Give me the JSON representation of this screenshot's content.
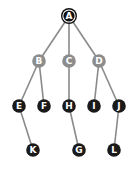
{
  "diagram": {
    "type": "tree",
    "colors": {
      "background": "#ffffff",
      "edge": "#8a8a8a",
      "root_fill": "#111111",
      "root_ring": "#111111",
      "level1_fill": "#8c8c8c",
      "leaf_fill": "#1a1a1a",
      "label": "#ffffff"
    },
    "nodes": [
      {
        "id": "A",
        "label": "A",
        "x": 69,
        "y": 16,
        "style": "root"
      },
      {
        "id": "B",
        "label": "B",
        "x": 39,
        "y": 61,
        "style": "gray"
      },
      {
        "id": "C",
        "label": "C",
        "x": 69,
        "y": 61,
        "style": "gray"
      },
      {
        "id": "D",
        "label": "D",
        "x": 99,
        "y": 61,
        "style": "gray"
      },
      {
        "id": "E",
        "label": "E",
        "x": 19,
        "y": 106,
        "style": "dark"
      },
      {
        "id": "F",
        "label": "F",
        "x": 44,
        "y": 106,
        "style": "dark"
      },
      {
        "id": "H",
        "label": "H",
        "x": 69,
        "y": 106,
        "style": "dark"
      },
      {
        "id": "I",
        "label": "I",
        "x": 94,
        "y": 106,
        "style": "dark"
      },
      {
        "id": "J",
        "label": "J",
        "x": 119,
        "y": 106,
        "style": "dark"
      },
      {
        "id": "K",
        "label": "K",
        "x": 33,
        "y": 150,
        "style": "dark"
      },
      {
        "id": "G",
        "label": "G",
        "x": 79,
        "y": 150,
        "style": "dark"
      },
      {
        "id": "L",
        "label": "L",
        "x": 114,
        "y": 150,
        "style": "dark"
      }
    ],
    "edges": [
      [
        "A",
        "B"
      ],
      [
        "A",
        "C"
      ],
      [
        "A",
        "D"
      ],
      [
        "B",
        "E"
      ],
      [
        "B",
        "F"
      ],
      [
        "C",
        "H"
      ],
      [
        "D",
        "I"
      ],
      [
        "D",
        "J"
      ],
      [
        "E",
        "K"
      ],
      [
        "H",
        "G"
      ],
      [
        "J",
        "L"
      ]
    ]
  }
}
